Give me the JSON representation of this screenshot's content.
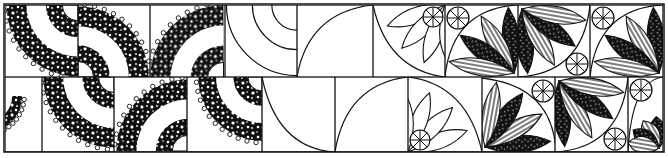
{
  "figure": {
    "title": "",
    "colors": {
      "ink": "#111111",
      "paper": "#ffffff"
    },
    "rows": [
      {
        "y": 5,
        "h": 72,
        "cells": [
          {
            "x": 5,
            "type": "arc-scribble",
            "rot": 0
          },
          {
            "x": 78,
            "type": "arc-scribble",
            "rot": 180
          },
          {
            "x": 150,
            "type": "arc-scribble",
            "rot": 90
          },
          {
            "x": 225,
            "type": "concentric-arcs",
            "rot": 0
          },
          {
            "x": 297,
            "type": "quarter-curve",
            "rot": 0
          },
          {
            "x": 373,
            "type": "fan-outline",
            "rot": 0
          },
          {
            "x": 445,
            "type": "fan-filled",
            "rot": 0
          },
          {
            "x": 518,
            "type": "fan-filled",
            "rot": 180
          },
          {
            "x": 590,
            "type": "fan-filled",
            "rot": 0
          }
        ]
      },
      {
        "y": 77,
        "h": 75,
        "cells": [
          {
            "x": 5,
            "type": "arc-scribble",
            "rot": 270
          },
          {
            "x": 42,
            "type": "arc-scribble",
            "rot": 0
          },
          {
            "x": 114,
            "type": "arc-scribble",
            "rot": 90
          },
          {
            "x": 187,
            "type": "arc-scribble-small",
            "rot": 0
          },
          {
            "x": 262,
            "type": "quarter-curve-inv",
            "rot": 0
          },
          {
            "x": 335,
            "type": "quarter-curve",
            "rot": 0
          },
          {
            "x": 408,
            "type": "fan-outline",
            "rot": 180
          },
          {
            "x": 482,
            "type": "fan-filled",
            "rot": 90
          },
          {
            "x": 555,
            "type": "fan-filled",
            "rot": 180
          },
          {
            "x": 628,
            "type": "fan-filled-partial",
            "rot": 0
          }
        ]
      }
    ]
  }
}
